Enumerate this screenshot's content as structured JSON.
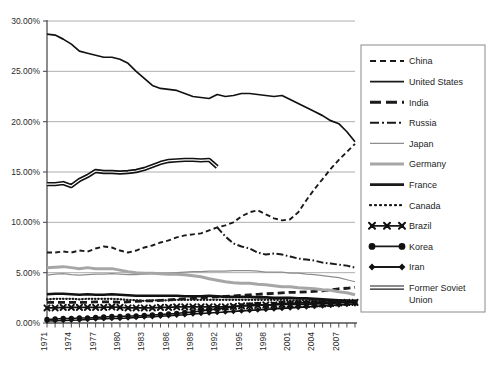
{
  "chart_data": {
    "type": "line",
    "title": "",
    "xlabel": "",
    "ylabel": "",
    "ylim": [
      0,
      30
    ],
    "ytick_labels": [
      "0.00%",
      "5.00%",
      "10.00%",
      "15.00%",
      "20.00%",
      "25.00%",
      "30.00%"
    ],
    "ytick_values": [
      0,
      5,
      10,
      15,
      20,
      25,
      30
    ],
    "grid": true,
    "legend_position": "right",
    "x": [
      1971,
      1972,
      1973,
      1974,
      1975,
      1976,
      1977,
      1978,
      1979,
      1980,
      1981,
      1982,
      1983,
      1984,
      1985,
      1986,
      1987,
      1988,
      1989,
      1990,
      1991,
      1992,
      1993,
      1994,
      1995,
      1996,
      1997,
      1998,
      1999,
      2000,
      2001,
      2002,
      2003,
      2004,
      2005,
      2006,
      2007,
      2008,
      2009
    ],
    "xtick_labels": [
      "1971",
      "1974",
      "1977",
      "1980",
      "1983",
      "1986",
      "1989",
      "1992",
      "1995",
      "1998",
      "2001",
      "2004",
      "2007"
    ],
    "xtick_values": [
      1971,
      1974,
      1977,
      1980,
      1983,
      1986,
      1989,
      1992,
      1995,
      1998,
      2001,
      2004,
      2007
    ],
    "series": [
      {
        "name": "China",
        "style": "dashed",
        "color": "#1a1a1a",
        "width": 1.9,
        "values": [
          7.0,
          7.0,
          7.1,
          7.0,
          7.2,
          7.1,
          7.4,
          7.6,
          7.5,
          7.2,
          7.0,
          7.2,
          7.5,
          7.7,
          8.0,
          8.2,
          8.5,
          8.7,
          8.8,
          8.9,
          9.2,
          9.5,
          9.7,
          10.0,
          10.6,
          11.0,
          11.2,
          10.8,
          10.4,
          10.2,
          10.3,
          11.0,
          12.2,
          13.3,
          14.3,
          15.3,
          16.2,
          17.0,
          17.8
        ]
      },
      {
        "name": "United States",
        "style": "solid",
        "color": "#111111",
        "width": 1.7,
        "values": [
          28.7,
          28.6,
          28.2,
          27.7,
          27.0,
          26.8,
          26.6,
          26.4,
          26.4,
          26.2,
          25.8,
          25.0,
          24.3,
          23.6,
          23.3,
          23.2,
          23.1,
          22.8,
          22.5,
          22.4,
          22.3,
          22.7,
          22.5,
          22.6,
          22.8,
          22.8,
          22.7,
          22.6,
          22.5,
          22.6,
          22.2,
          21.8,
          21.4,
          21.0,
          20.6,
          20.1,
          19.8,
          19.0,
          18.0
        ]
      },
      {
        "name": "India",
        "style": "thick-dashed",
        "color": "#1a1a1a",
        "width": 2.8,
        "values": [
          2.05,
          2.05,
          2.05,
          2.05,
          2.05,
          2.05,
          2.1,
          2.1,
          2.1,
          2.05,
          2.1,
          2.15,
          2.2,
          2.2,
          2.25,
          2.3,
          2.35,
          2.4,
          2.45,
          2.5,
          2.55,
          2.6,
          2.65,
          2.7,
          2.75,
          2.8,
          2.85,
          2.9,
          2.95,
          3.0,
          3.05,
          3.05,
          3.1,
          3.15,
          3.2,
          3.3,
          3.4,
          3.45,
          3.55
        ]
      },
      {
        "name": "Russia",
        "style": "dash-dot",
        "color": "#1a1a1a",
        "width": 2.0,
        "values": [
          null,
          null,
          null,
          null,
          null,
          null,
          null,
          null,
          null,
          null,
          null,
          null,
          null,
          null,
          null,
          null,
          null,
          null,
          null,
          null,
          null,
          9.5,
          8.6,
          7.9,
          7.6,
          7.4,
          7.0,
          6.8,
          6.9,
          6.8,
          6.6,
          6.4,
          6.3,
          6.2,
          6.0,
          5.9,
          5.8,
          5.7,
          5.5
        ]
      },
      {
        "name": "Japan",
        "style": "solid",
        "color": "#8d8d8d",
        "width": 1.2,
        "values": [
          4.75,
          4.85,
          4.9,
          4.8,
          4.75,
          4.8,
          4.85,
          4.85,
          4.9,
          4.85,
          4.8,
          4.8,
          4.85,
          4.95,
          4.95,
          4.95,
          5.0,
          5.05,
          5.1,
          5.1,
          5.15,
          5.15,
          5.15,
          5.2,
          5.2,
          5.2,
          5.15,
          5.05,
          5.05,
          5.05,
          4.95,
          4.95,
          4.85,
          4.8,
          4.7,
          4.6,
          4.5,
          4.3,
          4.1
        ]
      },
      {
        "name": "Germany",
        "style": "solid",
        "color": "#a6a6a6",
        "width": 3.0,
        "values": [
          5.5,
          5.55,
          5.6,
          5.5,
          5.4,
          5.5,
          5.4,
          5.4,
          5.4,
          5.25,
          5.1,
          5.0,
          4.95,
          4.95,
          4.9,
          4.85,
          4.85,
          4.8,
          4.7,
          4.6,
          4.4,
          4.25,
          4.1,
          4.0,
          3.95,
          3.95,
          3.85,
          3.8,
          3.7,
          3.6,
          3.6,
          3.5,
          3.45,
          3.4,
          3.3,
          3.25,
          3.1,
          3.0,
          2.8
        ]
      },
      {
        "name": "France",
        "style": "solid",
        "color": "#111111",
        "width": 2.6,
        "values": [
          2.85,
          2.9,
          2.9,
          2.85,
          2.8,
          2.85,
          2.8,
          2.8,
          2.85,
          2.8,
          2.75,
          2.7,
          2.7,
          2.7,
          2.7,
          2.7,
          2.7,
          2.65,
          2.65,
          2.65,
          2.7,
          2.65,
          2.6,
          2.6,
          2.6,
          2.6,
          2.55,
          2.55,
          2.5,
          2.5,
          2.5,
          2.45,
          2.45,
          2.4,
          2.35,
          2.3,
          2.25,
          2.2,
          2.15
        ]
      },
      {
        "name": "Canada",
        "style": "dotted",
        "color": "#1a1a1a",
        "width": 2.2,
        "values": [
          2.35,
          2.4,
          2.4,
          2.4,
          2.35,
          2.4,
          2.4,
          2.4,
          2.4,
          2.35,
          2.3,
          2.25,
          2.2,
          2.25,
          2.25,
          2.25,
          2.3,
          2.3,
          2.3,
          2.3,
          2.3,
          2.3,
          2.3,
          2.3,
          2.3,
          2.3,
          2.3,
          2.3,
          2.3,
          2.3,
          2.25,
          2.25,
          2.25,
          2.2,
          2.2,
          2.15,
          2.15,
          2.1,
          2.05
        ]
      },
      {
        "name": "Brazil",
        "style": "marker-x",
        "color": "#111111",
        "width": 1.6,
        "values": [
          1.5,
          1.5,
          1.55,
          1.55,
          1.55,
          1.55,
          1.55,
          1.55,
          1.6,
          1.55,
          1.5,
          1.5,
          1.5,
          1.5,
          1.55,
          1.55,
          1.6,
          1.6,
          1.6,
          1.6,
          1.6,
          1.6,
          1.6,
          1.65,
          1.7,
          1.7,
          1.75,
          1.8,
          1.8,
          1.85,
          1.85,
          1.85,
          1.85,
          1.9,
          1.9,
          1.95,
          2.0,
          2.05,
          2.05
        ]
      },
      {
        "name": "Korea",
        "style": "marker-circle",
        "color": "#111111",
        "width": 1.6,
        "values": [
          0.35,
          0.4,
          0.45,
          0.45,
          0.5,
          0.5,
          0.55,
          0.6,
          0.65,
          0.65,
          0.7,
          0.7,
          0.75,
          0.8,
          0.85,
          0.9,
          0.95,
          1.05,
          1.1,
          1.2,
          1.3,
          1.4,
          1.5,
          1.6,
          1.7,
          1.8,
          1.85,
          1.75,
          1.85,
          1.95,
          1.95,
          2.0,
          2.0,
          2.0,
          2.05,
          2.05,
          2.1,
          2.1,
          2.1
        ]
      },
      {
        "name": "Iran",
        "style": "marker-diamond",
        "color": "#111111",
        "width": 1.6,
        "values": [
          0.2,
          0.22,
          0.25,
          0.28,
          0.3,
          0.35,
          0.4,
          0.42,
          0.45,
          0.45,
          0.5,
          0.55,
          0.6,
          0.62,
          0.68,
          0.72,
          0.78,
          0.82,
          0.9,
          0.95,
          1.0,
          1.05,
          1.1,
          1.15,
          1.2,
          1.25,
          1.3,
          1.35,
          1.4,
          1.45,
          1.5,
          1.55,
          1.6,
          1.65,
          1.7,
          1.75,
          1.8,
          1.85,
          1.9
        ]
      },
      {
        "name": "Former Soviet Union",
        "style": "double-line",
        "color": "#111111",
        "width": 2.2,
        "values": [
          13.8,
          13.8,
          13.9,
          13.6,
          14.2,
          14.6,
          15.1,
          15.0,
          15.0,
          14.95,
          15.0,
          15.1,
          15.3,
          15.6,
          15.9,
          16.1,
          16.15,
          16.2,
          16.2,
          16.15,
          16.2,
          15.5,
          null,
          null,
          null,
          null,
          null,
          null,
          null,
          null,
          null,
          null,
          null,
          null,
          null,
          null,
          null,
          null,
          null
        ]
      }
    ]
  },
  "legend": {
    "items": [
      {
        "label": "China",
        "style": "dashed"
      },
      {
        "label": "United States",
        "style": "solid"
      },
      {
        "label": "India",
        "style": "thick-dashed"
      },
      {
        "label": "Russia",
        "style": "dash-dot"
      },
      {
        "label": "Japan",
        "style": "thin-gray"
      },
      {
        "label": "Germany",
        "style": "thick-gray"
      },
      {
        "label": "France",
        "style": "thick-black"
      },
      {
        "label": "Canada",
        "style": "dotted"
      },
      {
        "label": "Brazil",
        "style": "marker-x"
      },
      {
        "label": "Korea",
        "style": "marker-circle"
      },
      {
        "label": "Iran",
        "style": "marker-diamond"
      },
      {
        "label": "Former Soviet Union",
        "style": "double-line"
      }
    ]
  },
  "colors": {
    "axis": "#6f6f6f",
    "grid": "#9a9a9a",
    "text": "#2b2b2b",
    "legend_border": "#8a8a8a",
    "background": "#ffffff"
  }
}
